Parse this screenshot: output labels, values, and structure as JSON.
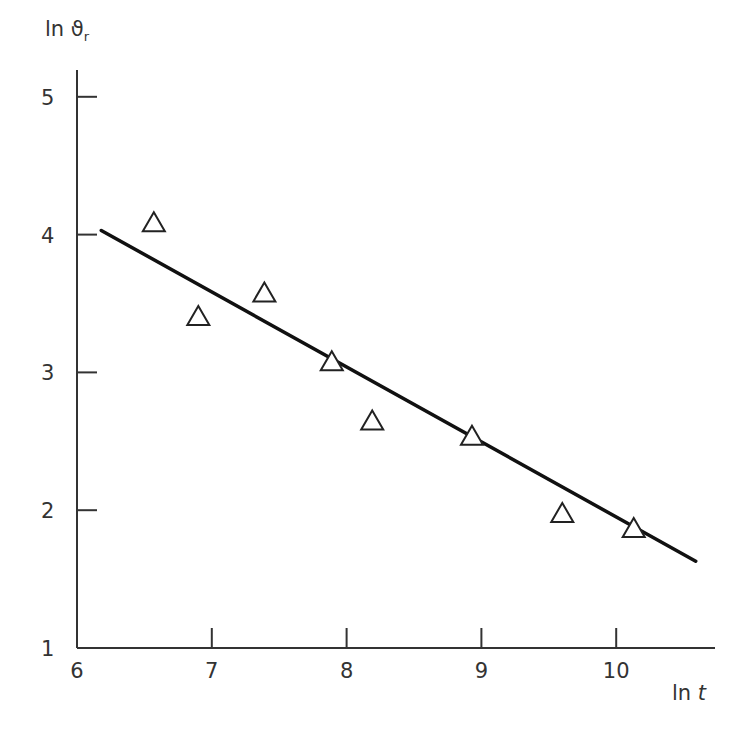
{
  "chart_data": {
    "type": "scatter",
    "title": "",
    "xlabel": "ln t",
    "ylabel": "ln ϑr",
    "xlim": [
      6,
      10.75
    ],
    "ylim": [
      1,
      5.2
    ],
    "x_ticks": [
      6,
      7,
      8,
      9,
      10
    ],
    "y_ticks": [
      1,
      2,
      3,
      4,
      5
    ],
    "grid": false,
    "legend": null,
    "series": [
      {
        "name": "measurements",
        "marker": "open-triangle",
        "x": [
          6.57,
          6.9,
          7.39,
          7.89,
          8.19,
          8.93,
          9.6,
          10.13
        ],
        "y": [
          4.08,
          3.4,
          3.57,
          3.07,
          2.64,
          2.53,
          1.97,
          1.86
        ]
      },
      {
        "name": "linear fit",
        "style": "line",
        "x": [
          6.18,
          10.59
        ],
        "y": [
          4.03,
          1.63
        ]
      }
    ]
  },
  "labels": {
    "y_axis_title_main": "ln ϑ",
    "y_axis_title_sub": "r",
    "x_axis_title_main": "ln ",
    "x_axis_title_var": "t",
    "x_tick_labels": [
      "6",
      "7",
      "8",
      "9",
      "10"
    ],
    "y_tick_labels": [
      "1",
      "2",
      "3",
      "4",
      "5"
    ]
  },
  "caption": ""
}
